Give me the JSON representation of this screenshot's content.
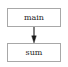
{
  "diagram": {
    "type": "call-graph",
    "background_color": "#ffffff",
    "node_border_color": "#a8a8a8",
    "node_fill_color": "#ffffff",
    "label_color": "#272727",
    "edge_color": "#1a1a1a",
    "nodes": [
      {
        "id": "main",
        "label": "main"
      },
      {
        "id": "sum",
        "label": "sum"
      }
    ],
    "edges": [
      {
        "from": "main",
        "to": "sum",
        "arrowhead": "normal",
        "direction": "down"
      }
    ]
  }
}
